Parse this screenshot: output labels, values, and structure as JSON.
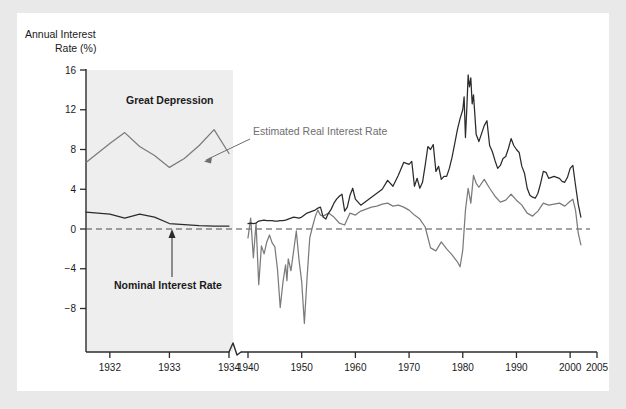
{
  "figure": {
    "background_color": "#ffffff",
    "frame_color": "#e9e9e9",
    "panel_color": "#ffffff"
  },
  "axis": {
    "y_title_line1": "Annual Interest",
    "y_title_line2": "Rate (%)",
    "y_ticks": [
      "16",
      "12",
      "8",
      "4",
      "0",
      "−4",
      "−8"
    ],
    "x_ticks": [
      "1932",
      "1933",
      "1934",
      "1940",
      "1950",
      "1960",
      "1970",
      "1980",
      "1990",
      "2000",
      "2005"
    ],
    "axis_break_symbol": "zigzag-break"
  },
  "annotations": {
    "great_depression": "Great Depression",
    "real_rate_label": "Estimated Real Interest Rate",
    "nominal_rate_label": "Nominal Interest Rate"
  },
  "colors": {
    "nominal_line": "#2b2b2b",
    "real_line": "#7b7b7b",
    "zero_line": "#4a4a4a",
    "shade": "#eeeeee",
    "axis": "#2b2b2b"
  },
  "chart_data": {
    "type": "line",
    "title": "",
    "xlabel": "",
    "ylabel": "Annual Interest Rate (%)",
    "ylim": [
      -10.5,
      16.5
    ],
    "grid": false,
    "legend_position": "inline-annotations",
    "axis_break": {
      "after": 1934,
      "before": 1940
    },
    "shaded_regions": [
      {
        "label": "Great Depression",
        "x_start": 1931.6,
        "x_end": 1934.0
      }
    ],
    "reference_lines": [
      {
        "y": 0,
        "style": "dashed"
      }
    ],
    "series": [
      {
        "name": "Nominal Interest Rate",
        "color": "#2b2b2b",
        "x": [
          1931.6,
          1932.0,
          1932.25,
          1932.5,
          1932.75,
          1933.0,
          1933.25,
          1933.5,
          1933.75,
          1934.0,
          1940.0,
          1940.5,
          1941.0,
          1941.5,
          1942.0,
          1942.5,
          1943.0,
          1943.5,
          1944.0,
          1944.5,
          1945.0,
          1945.5,
          1946.0,
          1946.5,
          1947.0,
          1947.5,
          1948.0,
          1948.5,
          1949.0,
          1949.5,
          1950.0,
          1950.5,
          1951.0,
          1951.5,
          1952.0,
          1952.5,
          1953.0,
          1953.5,
          1954.0,
          1954.5,
          1955.0,
          1955.5,
          1956.0,
          1956.5,
          1957.0,
          1957.5,
          1958.0,
          1958.5,
          1959.0,
          1959.5,
          1960.0,
          1961.0,
          1962.0,
          1963.0,
          1964.0,
          1965.0,
          1966.0,
          1967.0,
          1968.0,
          1969.0,
          1970.0,
          1970.5,
          1971.0,
          1971.5,
          1972.0,
          1972.5,
          1973.0,
          1973.5,
          1974.0,
          1974.5,
          1975.0,
          1975.5,
          1976.0,
          1976.5,
          1977.0,
          1977.5,
          1978.0,
          1978.5,
          1979.0,
          1979.5,
          1980.0,
          1980.25,
          1980.5,
          1980.75,
          1981.0,
          1981.25,
          1981.5,
          1981.75,
          1982.0,
          1982.5,
          1983.0,
          1983.5,
          1984.0,
          1984.5,
          1985.0,
          1985.5,
          1986.0,
          1986.5,
          1987.0,
          1987.5,
          1988.0,
          1988.5,
          1989.0,
          1989.5,
          1990.0,
          1990.5,
          1991.0,
          1991.5,
          1992.0,
          1992.5,
          1993.0,
          1993.5,
          1994.0,
          1994.5,
          1995.0,
          1995.5,
          1996.0,
          1996.5,
          1997.0,
          1997.5,
          1998.0,
          1998.5,
          1999.0,
          1999.5,
          2000.0,
          2000.5,
          2001.0,
          2001.5,
          2002.0
        ],
        "y": [
          1.7,
          1.5,
          1.1,
          1.5,
          1.2,
          0.55,
          0.45,
          0.35,
          0.3,
          0.3,
          0.55,
          0.6,
          0.55,
          0.6,
          0.8,
          0.85,
          0.9,
          0.85,
          0.85,
          0.85,
          0.8,
          0.8,
          0.85,
          0.85,
          0.9,
          1.0,
          1.1,
          1.2,
          1.15,
          1.1,
          1.2,
          1.4,
          1.6,
          1.7,
          1.8,
          1.9,
          2.1,
          2.2,
          1.2,
          1.0,
          1.6,
          2.0,
          2.6,
          3.0,
          3.3,
          3.5,
          1.8,
          2.2,
          3.4,
          4.1,
          3.0,
          2.4,
          2.8,
          3.2,
          3.6,
          4.0,
          4.9,
          4.3,
          5.4,
          6.7,
          6.5,
          6.8,
          4.3,
          5.1,
          4.1,
          4.7,
          6.4,
          8.3,
          8.0,
          8.5,
          5.8,
          6.3,
          5.0,
          5.3,
          5.3,
          6.1,
          7.2,
          8.6,
          10.0,
          11.1,
          12.0,
          13.3,
          9.2,
          12.1,
          15.5,
          14.3,
          15.2,
          12.6,
          13.5,
          9.5,
          8.8,
          9.6,
          10.4,
          10.9,
          8.4,
          7.8,
          6.9,
          6.1,
          6.4,
          7.1,
          7.3,
          8.1,
          9.1,
          8.4,
          8.0,
          7.7,
          6.3,
          5.6,
          4.1,
          3.4,
          3.2,
          3.1,
          3.6,
          4.6,
          5.8,
          5.7,
          5.1,
          5.2,
          5.3,
          5.2,
          5.1,
          4.8,
          4.7,
          5.2,
          6.1,
          6.4,
          4.4,
          2.5,
          1.2
        ]
      },
      {
        "name": "Estimated Real Interest Rate",
        "color": "#7b7b7b",
        "x": [
          1931.6,
          1932.0,
          1932.25,
          1932.5,
          1932.75,
          1933.0,
          1933.25,
          1933.5,
          1933.75,
          1934.0,
          1940.0,
          1940.5,
          1941.0,
          1941.5,
          1942.0,
          1942.5,
          1943.0,
          1943.5,
          1944.0,
          1944.5,
          1945.0,
          1945.5,
          1946.0,
          1946.5,
          1947.0,
          1947.25,
          1947.5,
          1948.0,
          1948.5,
          1949.0,
          1949.5,
          1950.0,
          1950.5,
          1951.0,
          1951.5,
          1952.0,
          1952.5,
          1953.0,
          1953.5,
          1954.0,
          1955.0,
          1956.0,
          1957.0,
          1958.0,
          1959.0,
          1960.0,
          1961.0,
          1962.0,
          1963.0,
          1964.0,
          1965.0,
          1966.0,
          1967.0,
          1968.0,
          1969.0,
          1970.0,
          1971.0,
          1972.0,
          1973.0,
          1974.0,
          1975.0,
          1976.0,
          1977.0,
          1978.0,
          1979.0,
          1979.5,
          1980.0,
          1980.5,
          1981.0,
          1981.5,
          1982.0,
          1982.5,
          1983.0,
          1984.0,
          1985.0,
          1986.0,
          1987.0,
          1988.0,
          1989.0,
          1990.0,
          1991.0,
          1992.0,
          1993.0,
          1994.0,
          1995.0,
          1996.0,
          1997.0,
          1998.0,
          1999.0,
          2000.0,
          2000.5,
          2001.0,
          2001.5,
          2002.0
        ],
        "y": [
          6.7,
          8.6,
          9.7,
          8.3,
          7.4,
          6.2,
          7.1,
          8.4,
          10.0,
          7.6,
          -0.9,
          1.1,
          -2.9,
          0.6,
          -5.6,
          -1.7,
          -2.5,
          -1.3,
          -0.6,
          -1.4,
          -1.8,
          -4.1,
          -7.9,
          -5.4,
          -3.6,
          -5.2,
          -3.0,
          -4.2,
          -2.2,
          -0.2,
          -3.1,
          -5.3,
          -9.5,
          -4.9,
          -0.9,
          0.2,
          1.2,
          1.9,
          1.4,
          1.3,
          1.6,
          1.2,
          0.6,
          0.4,
          1.6,
          1.4,
          1.8,
          2.0,
          2.2,
          2.3,
          2.5,
          2.6,
          2.3,
          2.4,
          2.2,
          1.9,
          1.4,
          1.0,
          0.2,
          -1.9,
          -2.2,
          -1.3,
          -2.0,
          -2.6,
          -3.3,
          -3.8,
          -2.1,
          1.9,
          4.1,
          2.6,
          5.4,
          4.6,
          4.2,
          5.0,
          4.1,
          3.3,
          2.7,
          2.9,
          3.5,
          2.9,
          2.4,
          1.6,
          1.3,
          1.8,
          2.6,
          2.4,
          2.5,
          2.6,
          2.3,
          2.8,
          3.0,
          1.9,
          -0.4,
          -1.6
        ]
      }
    ]
  }
}
